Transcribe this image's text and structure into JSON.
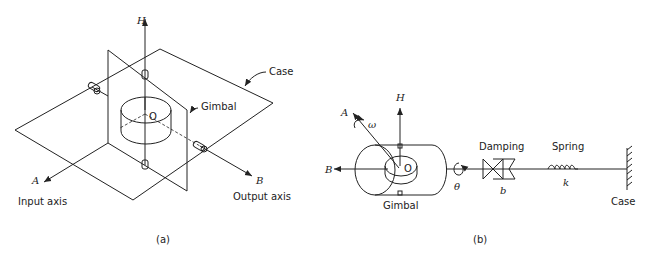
{
  "figure_a": {
    "caption": "(a)",
    "labels": {
      "h_axis": "H",
      "case": "Case",
      "gimbal": "Gimbal",
      "origin": "O",
      "a_axis": "A",
      "b_axis": "B",
      "input_axis": "Input axis",
      "output_axis": "Output axis"
    }
  },
  "figure_b": {
    "caption": "(b)",
    "labels": {
      "h_axis": "H",
      "a_axis": "A",
      "omega": "ω",
      "origin": "O",
      "b_axis": "B",
      "gimbal": "Gimbal",
      "theta": "θ",
      "damping": "Damping",
      "damping_coeff": "b",
      "spring": "Spring",
      "spring_const": "k",
      "case": "Case"
    }
  },
  "colors": {
    "line": "#222222",
    "background": "#ffffff"
  }
}
